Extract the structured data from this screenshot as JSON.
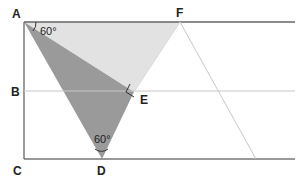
{
  "diagram": {
    "type": "geometry",
    "points": {
      "A": {
        "label": "A",
        "x": 24,
        "y": 22
      },
      "B": {
        "label": "B",
        "x": 24,
        "y": 91
      },
      "C": {
        "label": "C",
        "x": 24,
        "y": 159
      },
      "D": {
        "label": "D",
        "x": 102,
        "y": 159
      },
      "E": {
        "label": "E",
        "x": 134,
        "y": 92
      },
      "F": {
        "label": "F",
        "x": 180,
        "y": 22
      }
    },
    "angles": {
      "at_A": "60°",
      "at_D": "60°"
    },
    "right_angle_at": "E",
    "colors": {
      "dark_fill": "#9a9a9a",
      "light_fill": "#e2e2e2",
      "frame_line": "#666666",
      "light_line": "#c8c8c8",
      "label": "#222222"
    }
  }
}
